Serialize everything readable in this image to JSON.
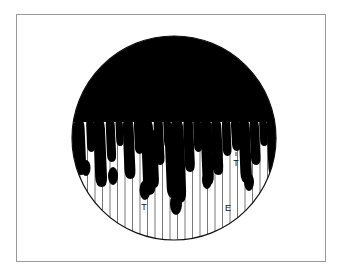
{
  "figure": {
    "frame": {
      "border_color": "#9a9a9a",
      "background_color": "#ffffff"
    },
    "circle": {
      "center_x": 174,
      "center_y": 138,
      "radius": 102,
      "outline_color": "#111111",
      "fill_color": "#ffffff"
    },
    "black_region": {
      "color": "#000000",
      "description": "upper portion of circle filled solid black with downward paint-drip lobes"
    },
    "striations": {
      "color": "#555555",
      "count": 26,
      "description": "thin vertical lines spanning lower half of circle"
    },
    "labels": [
      {
        "text": "T",
        "x": 146,
        "y": 210
      },
      {
        "text": "T",
        "x": 236,
        "y": 166
      },
      {
        "text": "E",
        "x": 228,
        "y": 211
      }
    ],
    "drips": {
      "count": 26,
      "lengths": [
        38,
        52,
        30,
        64,
        40,
        26,
        58,
        34,
        70,
        44,
        30,
        78,
        50,
        36,
        86,
        60,
        42,
        74,
        48,
        32,
        66,
        40,
        56,
        30,
        62,
        36
      ]
    }
  }
}
